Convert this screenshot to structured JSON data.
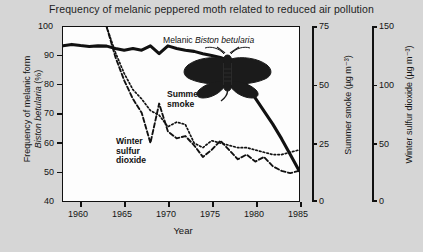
{
  "chart_data": {
    "type": "line",
    "title": "Frequency of melanic peppered moth related to reduced air pollution",
    "xlabel": "Year",
    "xlim": [
      1959,
      1986
    ],
    "xticks": [
      1960,
      1965,
      1970,
      1975,
      1980,
      1985
    ],
    "xticklabels": [
      "1960",
      "1965",
      "1970",
      "1975",
      "1980",
      "1985"
    ],
    "grid": false,
    "legend": "in-plot annotations",
    "axes": [
      {
        "id": "left",
        "label": "Frequency of melanic form of Biston betularia (%)",
        "label_plain": "Frequency of melanic form",
        "label_italic": "Biston betularia",
        "label_suffix": "(%)",
        "lim": [
          40,
          100
        ],
        "ticks": [
          40,
          50,
          60,
          70,
          80,
          90,
          100
        ],
        "ticklabels": [
          "40",
          "50",
          "60",
          "70",
          "80",
          "90",
          "100"
        ]
      },
      {
        "id": "right-smoke",
        "label": "Summer smoke (µg m⁻³)",
        "lim": [
          0,
          75
        ],
        "ticks": [
          0,
          25,
          50,
          75
        ],
        "ticklabels": [
          "0",
          "25",
          "50",
          "75"
        ]
      },
      {
        "id": "right-so2",
        "label": "Winter sulfur dioxide (µg m⁻³)",
        "lim": [
          0,
          150
        ],
        "ticks": [
          0,
          50,
          100,
          150
        ],
        "ticklabels": [
          "0",
          "50",
          "100",
          "150"
        ]
      }
    ],
    "series": [
      {
        "name": "Melanic frequency",
        "axis": "left",
        "style": "solid-thick",
        "color": "#111111",
        "x": [
          1959,
          1960,
          1961,
          1962,
          1963,
          1964,
          1965,
          1966,
          1967,
          1968,
          1969,
          1970,
          1971,
          1972,
          1973,
          1974,
          1975,
          1976,
          1977,
          1978,
          1979,
          1980,
          1981,
          1982,
          1983,
          1984,
          1985,
          1986
        ],
        "values": [
          93.5,
          94.0,
          93.6,
          93.3,
          93.5,
          93.4,
          92.6,
          92.0,
          92.6,
          92.0,
          93.5,
          90.8,
          93.5,
          92.6,
          92.0,
          91.6,
          90.8,
          90.2,
          89.5,
          88.4,
          84.5,
          80.0,
          75.5,
          71.0,
          66.5,
          61.5,
          56.0,
          50.5
        ]
      },
      {
        "name": "Summer smoke",
        "axis": "right-smoke",
        "style": "dashed",
        "color": "#111111",
        "x": [
          1964,
          1965,
          1966,
          1967,
          1968,
          1969,
          1970,
          1971,
          1972,
          1973,
          1974,
          1975,
          1976,
          1977,
          1978,
          1979,
          1980,
          1981,
          1982,
          1983,
          1984,
          1985,
          1986
        ],
        "values": [
          75,
          62,
          52,
          44,
          38,
          25,
          42,
          30,
          27,
          28,
          24,
          19,
          22,
          26,
          22,
          18,
          20,
          17,
          19,
          15,
          13,
          12,
          13
        ]
      },
      {
        "name": "Winter sulfur dioxide",
        "axis": "right-so2",
        "style": "dotted",
        "color": "#111111",
        "x": [
          1964,
          1965,
          1966,
          1967,
          1968,
          1969,
          1970,
          1971,
          1972,
          1973,
          1974,
          1975,
          1976,
          1977,
          1978,
          1979,
          1980,
          1981,
          1982,
          1983,
          1984,
          1985,
          1986
        ],
        "values": [
          150,
          128,
          110,
          96,
          88,
          78,
          74,
          64,
          68,
          66,
          50,
          46,
          52,
          50,
          48,
          46,
          46,
          44,
          42,
          40,
          40,
          42,
          44
        ]
      }
    ],
    "annotations": [
      {
        "id": "summer-smoke-label",
        "text": "Summer\nsmoke"
      },
      {
        "id": "winter-so2-label",
        "text": "Winter\nsulfur\ndioxide"
      },
      {
        "id": "moth-caption-plain",
        "text": "Melanic "
      },
      {
        "id": "moth-caption-italic",
        "text": "Biston betularia"
      }
    ]
  },
  "colors": {
    "background": "#d6d6d6",
    "plot_background": "#fdfdfd",
    "ink": "#111111"
  }
}
